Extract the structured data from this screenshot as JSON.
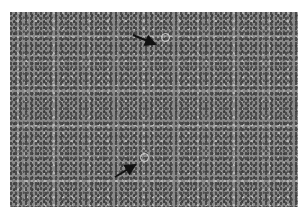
{
  "image": {
    "description": "Grayscale histology micrograph of densely packed small round cells with scattered larger pale cells",
    "arrows": [
      {
        "name": "arrow-top",
        "from": [
          133,
          35
        ],
        "to": [
          156,
          45
        ]
      },
      {
        "name": "arrow-bottom",
        "from": [
          115,
          176
        ],
        "to": [
          136,
          164
        ]
      }
    ],
    "highlighted_cells": [
      {
        "x": 165,
        "y": 38
      },
      {
        "x": 144,
        "y": 157
      }
    ],
    "colors": {
      "tissue": "#8a8a8a",
      "arrow": "#111111",
      "background": "#ffffff"
    }
  }
}
